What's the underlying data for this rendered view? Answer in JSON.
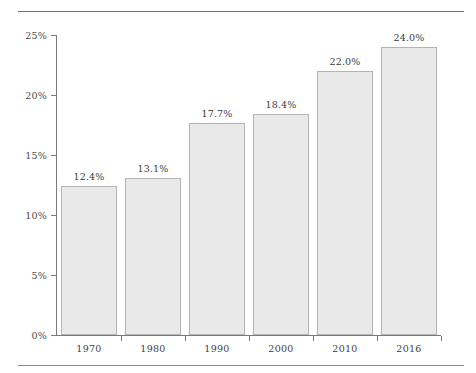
{
  "chart_data": {
    "type": "bar",
    "title": "",
    "subtitle": "",
    "xlabel": "",
    "ylabel": "",
    "categories": [
      "1970",
      "1980",
      "1990",
      "2000",
      "2010",
      "2016"
    ],
    "values": [
      12.4,
      13.1,
      17.7,
      18.4,
      22.0,
      24.0
    ],
    "value_labels": [
      "12.4%",
      "13.1%",
      "17.7%",
      "18.4%",
      "22.0%",
      "24.0%"
    ],
    "ylim": [
      0,
      25
    ],
    "ytick_values": [
      0,
      5,
      10,
      15,
      20,
      25
    ],
    "ytick_labels": [
      "0%",
      "5%",
      "10%",
      "15%",
      "20%",
      "25%"
    ],
    "grid": false,
    "legend": null,
    "legend_position": "none",
    "series": [
      {
        "name": "",
        "values": [
          12.4,
          13.1,
          17.7,
          18.4,
          22.0,
          24.0
        ]
      }
    ],
    "colors": {
      "bar_fill": "#e9e9e9",
      "bar_border": "#b4b4b4",
      "axis": "#7a7a7a",
      "text": "#3a3a3a",
      "rule": "#6e6e6e",
      "background": "#ffffff"
    }
  },
  "decor": {
    "top_rule": "",
    "bottom_rule": ""
  }
}
